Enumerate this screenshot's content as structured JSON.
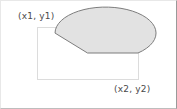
{
  "figure": {
    "type": "geometry-diagram",
    "canvas": {
      "width": 177,
      "height": 109,
      "background": "#ffffff",
      "border_color": "#9a9a9a"
    },
    "labels": [
      {
        "id": "p1",
        "text": "(x1, y1)",
        "anchor": "top-left",
        "color": "#4a4a4a"
      },
      {
        "id": "p2",
        "text": "(x2, y2)",
        "anchor": "bottom-right",
        "color": "#4a4a4a"
      }
    ],
    "bounding_box": {
      "name": "arc-bounding-rectangle",
      "x1": 36,
      "y1": 26,
      "x2": 137,
      "y2": 78,
      "stroke": "#dcdcdc",
      "fill": "none",
      "stroke_width": 1
    },
    "arc_shape": {
      "name": "pie-wedge",
      "center_x": 86.5,
      "center_y": 52,
      "radius_x": 50.5,
      "radius_y": 26,
      "start_angle_deg": 0,
      "end_angle_deg": 130,
      "sweep": "counterclockwise",
      "fill": "#e2e2e2",
      "stroke": "#7d7d7d",
      "stroke_width": 1,
      "path": "M 137 52 L 86.5 52 L 62.0 78.2 A 50.5 26 0 1 1 137 52 Z"
    }
  }
}
